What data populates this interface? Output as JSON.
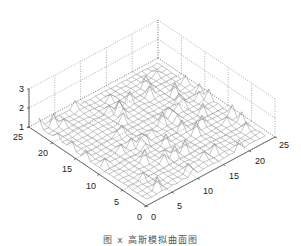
{
  "chart_data": {
    "type": "surface3d",
    "title": "",
    "caption": "图 x 高斯模拟曲面图",
    "xlabel": "",
    "ylabel": "",
    "zlabel": "",
    "x_range": [
      0,
      25
    ],
    "y_range": [
      0,
      25
    ],
    "z_range": [
      1,
      3
    ],
    "x_ticks": [
      0,
      5,
      10,
      15,
      20,
      25
    ],
    "y_ticks": [
      0,
      5,
      10,
      15,
      20,
      25
    ],
    "z_ticks": [
      1,
      2,
      3
    ],
    "grid": true,
    "grid_style": "dotted",
    "surface_style": "wireframe mesh",
    "surface_color": "#888888",
    "grid_size": [
      25,
      25
    ],
    "surface_description": "Random rough surface near z≈1 with scattered peaks up to ~1.5",
    "view": "isometric, origin at front-bottom corner"
  },
  "axes": {
    "left_ticks": [
      "25",
      "20",
      "15",
      "10",
      "5",
      "0"
    ],
    "right_ticks": [
      "0",
      "5",
      "10",
      "15",
      "20",
      "25"
    ],
    "z_ticks": [
      "3",
      "2",
      "1"
    ]
  }
}
